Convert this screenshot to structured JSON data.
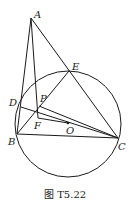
{
  "caption": "图 T5.22",
  "circle": {
    "cx": 68,
    "cy": 124,
    "r": 53
  },
  "points": {
    "A": {
      "x": 31,
      "y": 18,
      "label": "A"
    },
    "E": {
      "x": 69,
      "y": 71,
      "label": "E"
    },
    "D": {
      "x": 21,
      "y": 107,
      "label": "D"
    },
    "P": {
      "x": 39,
      "y": 106,
      "label": "P"
    },
    "F": {
      "x": 38,
      "y": 118,
      "label": "F"
    },
    "O": {
      "x": 68,
      "y": 123,
      "label": "O"
    },
    "B": {
      "x": 17,
      "y": 134,
      "label": "B"
    },
    "C": {
      "x": 118,
      "y": 138,
      "label": "C"
    }
  },
  "segments": [
    [
      "A",
      "B"
    ],
    [
      "A",
      "F"
    ],
    [
      "A",
      "C"
    ],
    [
      "B",
      "C"
    ],
    [
      "B",
      "E"
    ],
    [
      "D",
      "C"
    ],
    [
      "P",
      "C"
    ],
    [
      "F",
      "O"
    ],
    [
      "D",
      "P"
    ]
  ]
}
